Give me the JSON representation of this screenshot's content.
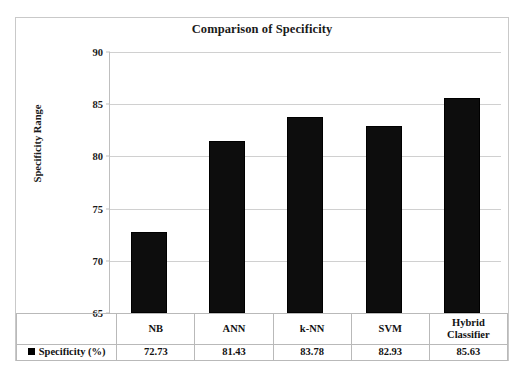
{
  "chart_data": {
    "type": "bar",
    "title": "Comparison of Specificity",
    "xlabel": "",
    "ylabel": "Specificity Range",
    "categories": [
      "NB",
      "ANN",
      "k-NN",
      "SVM",
      "Hybrid Classifier"
    ],
    "series": [
      {
        "name": "Specificity (%)",
        "values": [
          72.73,
          81.43,
          83.78,
          82.93,
          85.63
        ]
      }
    ],
    "value_labels": [
      "72.73",
      "81.43",
      "83.78",
      "82.93",
      "85.63"
    ],
    "ylim": [
      65,
      90
    ],
    "yticks": [
      65,
      70,
      75,
      80,
      85,
      90
    ],
    "ytick_labels": [
      "65",
      "70",
      "75",
      "80",
      "85",
      "90"
    ],
    "grid": true,
    "legend_position": "bottom-left-table",
    "bar_color": "#0d0d0d",
    "gridline_color": "#d0d0d0",
    "frame_color": "#c9c9c9",
    "has_data_table": true
  },
  "table": {
    "legend_label": "Specificity (%)",
    "legend_marker": "black-square-marker"
  }
}
